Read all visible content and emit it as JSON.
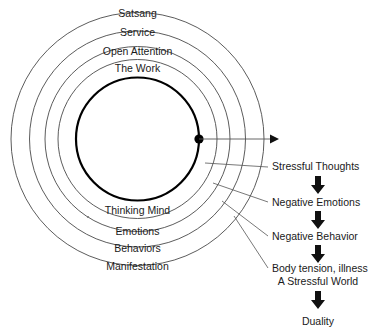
{
  "diagram": {
    "background_color": "#ffffff",
    "ink_color": "#1a1a1a",
    "ring_stroke_color": "#4a4a4a",
    "core_stroke_color": "#000000",
    "center": {
      "x": 137.5,
      "y": 139
    },
    "rings": [
      {
        "label": "Satsang",
        "radius": 126.5,
        "label_y": 17,
        "name": "ring-satsang"
      },
      {
        "label": "Service",
        "radius": 108.0,
        "label_y": 36,
        "name": "ring-service"
      },
      {
        "label": "Open Attention",
        "radius": 92.5,
        "label_y": 55,
        "name": "ring-open-attention"
      },
      {
        "label": "The Work",
        "radius": 79.5,
        "label_y": 72,
        "name": "ring-the-work"
      }
    ],
    "core": {
      "label": "Thinking Mind",
      "radius": 61.5,
      "label_y": 214,
      "name": "core-thinking-mind"
    },
    "inner_rings_lower": [
      {
        "label": "Emotions",
        "radius": 79.5,
        "label_y": 235,
        "name": "ring-emotions"
      },
      {
        "label": "Behaviors",
        "radius": 92.5,
        "label_y": 252,
        "name": "ring-behaviors"
      },
      {
        "label": "Manifestation",
        "radius": 108.0,
        "label_y": 270,
        "name": "ring-manifestation"
      }
    ],
    "origin_dot": {
      "x": 199,
      "y": 139,
      "radius": 4.6,
      "name": "origin-dot"
    },
    "axis_arrow": {
      "from_x": 199,
      "to_x": 279,
      "y": 139,
      "head_width": 9,
      "head_height": 9,
      "name": "outward-axis-arrow"
    },
    "chain": {
      "arrow_center_x": 318,
      "items": [
        {
          "label": "Stressful Thoughts",
          "text_x": 272,
          "text_y": 170,
          "align": "start",
          "leader": {
            "x1": 205,
            "y1": 163,
            "x2": 268,
            "y2": 167
          },
          "name": "chain-stressful-thoughts"
        },
        {
          "label": "Negative Emotions",
          "text_x": 272,
          "text_y": 206,
          "align": "start",
          "leader": {
            "x1": 213,
            "y1": 183,
            "x2": 268,
            "y2": 202
          },
          "name": "chain-negative-emotions"
        },
        {
          "label": "Negative Behavior",
          "text_x": 272,
          "text_y": 240,
          "align": "start",
          "leader": {
            "x1": 222,
            "y1": 201,
            "x2": 268,
            "y2": 236
          },
          "name": "chain-negative-behavior"
        },
        {
          "label": "Body tension, illness",
          "text_x": 272,
          "text_y": 272,
          "align": "start",
          "leader": {
            "x1": 234,
            "y1": 216,
            "x2": 268,
            "y2": 268
          },
          "name": "chain-body-tension"
        },
        {
          "label": "A Stressful World",
          "text_x": 318,
          "text_y": 285,
          "align": "middle",
          "leader": null,
          "name": "chain-stressful-world"
        },
        {
          "label": "Duality",
          "text_x": 318,
          "text_y": 325,
          "align": "middle",
          "leader": null,
          "name": "chain-duality"
        }
      ],
      "arrows": [
        {
          "y": 176,
          "name": "chain-arrow-1"
        },
        {
          "y": 211,
          "name": "chain-arrow-2"
        },
        {
          "y": 245,
          "name": "chain-arrow-3"
        },
        {
          "y": 291,
          "name": "chain-arrow-4"
        }
      ],
      "arrow_shape": {
        "shaft_width": 6,
        "shaft_height": 9,
        "head_width": 14,
        "head_height": 9
      }
    },
    "speck": {
      "x": 88,
      "y": 217,
      "radius": 1.1,
      "name": "ink-speck"
    }
  }
}
